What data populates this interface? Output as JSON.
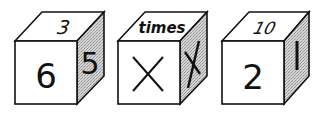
{
  "colors": {
    "outline": "#111111",
    "face": "#ffffff",
    "side_shade": "#c9c9c9",
    "side_dots": "#9a9a9a"
  },
  "cubes": [
    {
      "top": "3",
      "front": "6",
      "side": "5"
    },
    {
      "top": "times",
      "front": "×",
      "side": "X"
    },
    {
      "top": "10",
      "front": "2",
      "side": "1"
    }
  ]
}
